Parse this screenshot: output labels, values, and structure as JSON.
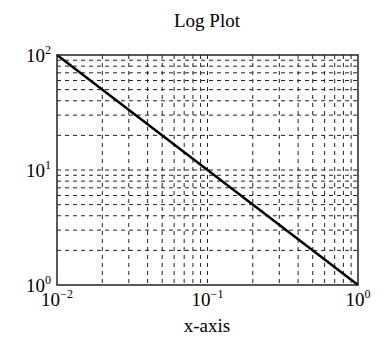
{
  "chart_data": {
    "type": "line",
    "title": "Log Plot",
    "xlabel": "x-axis",
    "ylabel": "",
    "xscale": "log",
    "yscale": "log",
    "xlim": [
      0.01,
      1
    ],
    "ylim": [
      1,
      100
    ],
    "grid": true,
    "grid_style": "dashed",
    "x_ticks": [
      {
        "value": 0.01,
        "base": "10",
        "exp": "−2"
      },
      {
        "value": 0.1,
        "base": "10",
        "exp": "−1"
      },
      {
        "value": 1,
        "base": "10",
        "exp": "0"
      }
    ],
    "y_ticks": [
      {
        "value": 1,
        "base": "10",
        "exp": "0"
      },
      {
        "value": 10,
        "base": "10",
        "exp": "1"
      },
      {
        "value": 100,
        "base": "10",
        "exp": "2"
      }
    ],
    "series": [
      {
        "name": "y = 1/x",
        "x": [
          0.01,
          0.1,
          1
        ],
        "y": [
          100,
          10,
          1
        ],
        "color": "#000000"
      }
    ],
    "legend": null
  },
  "colors": {
    "line": "#000000",
    "grid": "#222222",
    "frame": "#222222",
    "background": "#ffffff"
  }
}
